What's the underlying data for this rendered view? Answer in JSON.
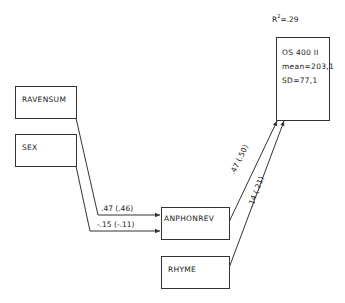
{
  "diagram": {
    "type": "path-diagram",
    "nodes": {
      "ravensum": {
        "label": "RAVENSUM"
      },
      "sex": {
        "label": "SEX"
      },
      "anphonrev": {
        "label": "ANPHONREV"
      },
      "rhyme": {
        "label": "RHYME"
      },
      "outcome": {
        "title": "OS 400 II",
        "mean": "mean=203,1",
        "sd": "SD=77,1"
      }
    },
    "r_squared": {
      "prefix": "R",
      "sup": "2",
      "value": "=.29"
    },
    "paths": [
      {
        "from": "RAVENSUM",
        "to": "ANPHONREV",
        "label": ".47 (.46)"
      },
      {
        "from": "SEX",
        "to": "ANPHONREV",
        "label": "-.15 (-.11)"
      },
      {
        "from": "ANPHONREV",
        "to": "OS 400 II",
        "label": ".47 (.50)"
      },
      {
        "from": "RHYME",
        "to": "OS 400 II",
        "label": ".14 (.21)"
      }
    ],
    "colors": {
      "line": "#333333",
      "background": "#ffffff"
    }
  }
}
